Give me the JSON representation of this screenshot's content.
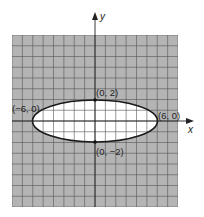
{
  "diagram": {
    "type": "ellipse-on-grid",
    "equation_semantics": "x^2/36 + y^2/4 = 1",
    "grid": {
      "xmin": -8,
      "xmax": 8,
      "ymin": -8,
      "ymax": 8
    },
    "colors": {
      "shade": "#b4b4b4",
      "gridline": "#555555",
      "interior": "#ffffff",
      "curve": "#1a1a1a"
    },
    "axes": {
      "x_label": "x",
      "y_label": "y"
    },
    "points": [
      {
        "label": "(0, 2)",
        "x": 0,
        "y": 2
      },
      {
        "label": "(0, −2)",
        "x": 0,
        "y": -2
      },
      {
        "label": "(−6, 0)",
        "x": -6,
        "y": 0
      },
      {
        "label": "(6, 0)",
        "x": 6,
        "y": 0
      }
    ]
  }
}
